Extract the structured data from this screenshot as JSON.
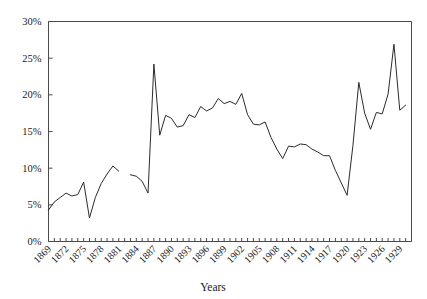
{
  "chart_data": {
    "type": "line",
    "title": "",
    "xlabel": "Years",
    "ylabel": "",
    "xlim": [
      1869,
      1931
    ],
    "ylim": [
      0,
      30
    ],
    "grid": false,
    "legend": null,
    "y_tick_labels": [
      "0%",
      "5%",
      "10%",
      "15%",
      "20%",
      "25%",
      "30%"
    ],
    "y_tick_values": [
      0,
      5,
      10,
      15,
      20,
      25,
      30
    ],
    "x_tick_labels": [
      "1869",
      "1872",
      "1875",
      "1878",
      "1881",
      "1884",
      "1887",
      "1890",
      "1893",
      "1896",
      "1899",
      "1902",
      "1905",
      "1908",
      "1911",
      "1914",
      "1917",
      "1920",
      "1923",
      "1926",
      "1929"
    ],
    "x_tick_values": [
      1869,
      1872,
      1875,
      1878,
      1881,
      1884,
      1887,
      1890,
      1893,
      1896,
      1899,
      1902,
      1905,
      1908,
      1911,
      1914,
      1917,
      1920,
      1923,
      1926,
      1929
    ],
    "x_tick_label_rotation": 45,
    "series": [
      {
        "name": "series-1",
        "color": "#2b2b2b",
        "x": [
          1869,
          1870,
          1871,
          1872,
          1873,
          1874,
          1875,
          1876,
          1877,
          1878,
          1879,
          1880,
          1881
        ],
        "values": [
          4.3,
          5.4,
          6.0,
          6.6,
          6.2,
          6.4,
          8.1,
          3.2,
          6.0,
          7.9,
          9.2,
          10.3,
          9.6
        ]
      },
      {
        "name": "series-1-continued",
        "color": "#2b2b2b",
        "x": [
          1883,
          1884,
          1885,
          1886,
          1887,
          1888,
          1889,
          1890,
          1891,
          1892,
          1893,
          1894,
          1895,
          1896,
          1897,
          1898,
          1899,
          1900,
          1901,
          1902,
          1903,
          1904,
          1905,
          1906,
          1907,
          1908,
          1909,
          1910,
          1911,
          1912,
          1913,
          1914,
          1915,
          1916,
          1917,
          1918,
          1919,
          1920,
          1921,
          1922,
          1923,
          1924,
          1925,
          1926,
          1927,
          1928,
          1929,
          1930
        ],
        "values": [
          9.1,
          8.9,
          8.2,
          6.6,
          24.2,
          14.5,
          17.2,
          16.8,
          15.6,
          15.8,
          17.3,
          16.9,
          18.4,
          17.8,
          18.2,
          19.5,
          18.8,
          19.1,
          18.7,
          20.2,
          17.3,
          16.0,
          15.9,
          16.3,
          14.2,
          12.6,
          11.3,
          13.0,
          12.9,
          13.3,
          13.2,
          12.6,
          12.2,
          11.7,
          11.7,
          9.7,
          8.0,
          6.3,
          13.1,
          21.7,
          17.5,
          15.3,
          17.6,
          17.4,
          20.1,
          26.9,
          17.9,
          18.6
        ]
      }
    ]
  }
}
